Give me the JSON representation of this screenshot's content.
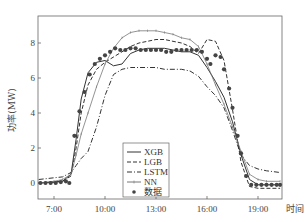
{
  "chart_data": {
    "type": "line",
    "title": "",
    "xlabel": "时间",
    "ylabel": "功率(MW)",
    "x_ticks": [
      "7:00",
      "10:00",
      "13:00",
      "16:00",
      "19:00"
    ],
    "y_ticks": [
      0,
      2,
      4,
      6,
      8
    ],
    "xlim": [
      6.05,
      20.4
    ],
    "ylim": [
      -0.9,
      9.6
    ],
    "grid": false,
    "legend_position": "lower center",
    "x_hours": [
      6.1,
      7.0,
      7.5,
      8.0,
      8.3,
      8.6,
      9.0,
      9.5,
      10.0,
      10.5,
      11.0,
      11.5,
      12.0,
      12.5,
      13.0,
      13.5,
      14.0,
      14.5,
      15.0,
      15.5,
      16.0,
      16.5,
      17.0,
      17.5,
      18.0,
      18.5,
      19.0,
      19.5,
      20.3
    ],
    "series": [
      {
        "name": "XGB",
        "style": "solid",
        "values": [
          0.0,
          0.05,
          0.1,
          0.5,
          2.5,
          4.8,
          6.3,
          6.9,
          7.0,
          6.7,
          6.8,
          7.4,
          7.6,
          7.7,
          7.7,
          7.7,
          7.6,
          7.5,
          7.5,
          7.3,
          6.6,
          5.8,
          4.9,
          3.5,
          1.6,
          0.2,
          -0.1,
          -0.1,
          -0.1
        ]
      },
      {
        "name": "LGB",
        "style": "dashed",
        "values": [
          0.0,
          0.05,
          0.1,
          0.4,
          2.0,
          4.0,
          5.6,
          6.5,
          6.9,
          7.2,
          7.5,
          7.8,
          8.0,
          8.1,
          8.2,
          8.2,
          8.1,
          8.0,
          7.8,
          7.4,
          8.2,
          8.1,
          7.0,
          4.2,
          1.2,
          -0.2,
          -0.3,
          -0.3,
          -0.3
        ]
      },
      {
        "name": "LSTM",
        "style": "dashdot",
        "values": [
          0.2,
          0.3,
          0.35,
          0.6,
          1.0,
          1.4,
          1.8,
          3.2,
          5.0,
          6.2,
          6.5,
          6.6,
          6.6,
          6.6,
          6.6,
          6.5,
          6.5,
          6.5,
          6.4,
          6.1,
          5.5,
          5.0,
          4.3,
          3.0,
          1.6,
          1.0,
          0.8,
          0.7,
          0.6
        ]
      },
      {
        "name": "NN",
        "style": "solid-marker",
        "values": [
          0.0,
          0.1,
          0.2,
          0.5,
          1.6,
          2.8,
          4.0,
          5.5,
          6.8,
          7.7,
          8.3,
          8.6,
          8.7,
          8.7,
          8.7,
          8.6,
          8.5,
          8.3,
          8.2,
          7.8,
          6.8,
          5.6,
          4.5,
          3.2,
          1.8,
          0.5,
          0.2,
          0.1,
          0.1
        ]
      }
    ],
    "scatter": {
      "name": "数据",
      "points": [
        [
          6.2,
          0.0
        ],
        [
          6.5,
          0.0
        ],
        [
          6.8,
          0.0
        ],
        [
          7.1,
          0.0
        ],
        [
          7.4,
          0.05
        ],
        [
          7.7,
          0.1
        ],
        [
          7.9,
          0.0
        ],
        [
          8.2,
          2.7
        ],
        [
          8.5,
          4.1
        ],
        [
          8.8,
          5.2
        ],
        [
          9.1,
          6.2
        ],
        [
          9.4,
          6.8
        ],
        [
          9.7,
          7.1
        ],
        [
          10.0,
          7.3
        ],
        [
          10.3,
          7.5
        ],
        [
          10.6,
          7.7
        ],
        [
          10.9,
          7.6
        ],
        [
          11.2,
          7.6
        ],
        [
          11.5,
          7.7
        ],
        [
          11.8,
          7.7
        ],
        [
          12.1,
          7.6
        ],
        [
          12.4,
          7.6
        ],
        [
          12.7,
          7.6
        ],
        [
          13.0,
          7.6
        ],
        [
          13.3,
          7.6
        ],
        [
          13.6,
          7.5
        ],
        [
          13.9,
          7.5
        ],
        [
          14.2,
          7.6
        ],
        [
          14.5,
          7.6
        ],
        [
          14.8,
          7.6
        ],
        [
          15.1,
          7.6
        ],
        [
          15.4,
          7.6
        ],
        [
          15.7,
          7.5
        ],
        [
          16.0,
          7.1
        ],
        [
          16.2,
          6.8
        ],
        [
          16.5,
          7.3
        ],
        [
          16.8,
          7.2
        ],
        [
          17.0,
          6.5
        ],
        [
          17.3,
          5.4
        ],
        [
          17.5,
          4.3
        ],
        [
          17.8,
          2.7
        ],
        [
          18.0,
          1.7
        ],
        [
          18.3,
          0.4
        ],
        [
          18.6,
          -0.1
        ],
        [
          18.9,
          -0.1
        ],
        [
          19.2,
          -0.1
        ],
        [
          19.5,
          -0.1
        ],
        [
          19.8,
          -0.1
        ],
        [
          20.1,
          -0.1
        ],
        [
          20.3,
          -0.1
        ]
      ]
    }
  },
  "colors": {
    "axis": "#555555",
    "line": "#333333",
    "nn_line": "#777777",
    "marker": "#444444"
  }
}
